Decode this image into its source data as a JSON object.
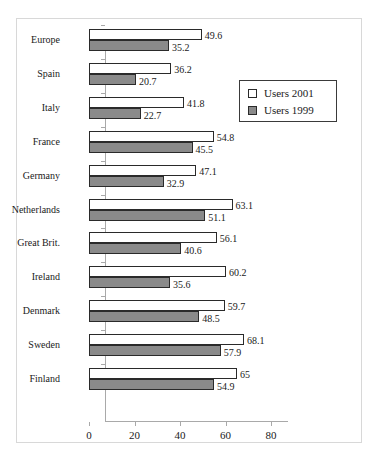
{
  "chart_data": {
    "type": "bar",
    "orientation": "horizontal",
    "title": "",
    "subtitle": "",
    "xlabel": "",
    "ylabel": "",
    "xlim": [
      0,
      80
    ],
    "xticks": [
      0,
      20,
      40,
      60,
      80
    ],
    "xticklabels": [
      "0",
      "20",
      "40",
      "60",
      "80"
    ],
    "grid": false,
    "legend_position": "top-right",
    "categories": [
      "Europe",
      "Spain",
      "Italy",
      "France",
      "Germany",
      "Netherlands",
      "Great Brit.",
      "Ireland",
      "Denmark",
      "Sweden",
      "Finland"
    ],
    "series": [
      {
        "name": "Users 2001",
        "color": "#ffffff",
        "edge_color": "#2a2a2a",
        "values": [
          49.6,
          36.2,
          41.8,
          54.8,
          47.1,
          63.1,
          56.1,
          60.2,
          59.7,
          68.1,
          65
        ],
        "labels": [
          "49.6",
          "36.2",
          "41.8",
          "54.8",
          "47.1",
          "63.1",
          "56.1",
          "60.2",
          "59.7",
          "68.1",
          "65"
        ]
      },
      {
        "name": "Users 1999",
        "color": "#8a8a8a",
        "edge_color": "#2a2a2a",
        "values": [
          35.2,
          20.7,
          22.7,
          45.5,
          32.9,
          51.1,
          40.6,
          35.6,
          48.5,
          57.9,
          54.9
        ],
        "labels": [
          "35.2",
          "20.7",
          "22.7",
          "45.5",
          "32.9",
          "51.1",
          "40.6",
          "35.6",
          "48.5",
          "57.9",
          "54.9"
        ]
      }
    ]
  },
  "legend": {
    "items": [
      {
        "label": "Users 2001",
        "swatch": "#ffffff"
      },
      {
        "label": "Users 1999",
        "swatch": "#8a8a8a"
      }
    ]
  }
}
